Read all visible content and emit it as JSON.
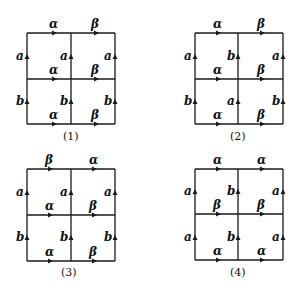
{
  "diagrams": [
    {
      "caption": "(1)",
      "top": {
        "left": "α",
        "right": "β"
      },
      "middle": {
        "left": "α",
        "right": "β"
      },
      "bottom": {
        "left": "α",
        "right": "β"
      },
      "upper_verticals": {
        "left": "a",
        "center": "a",
        "right": "a"
      },
      "lower_verticals": {
        "left": "b",
        "center": "b",
        "right": "b"
      }
    },
    {
      "caption": "(2)",
      "top": {
        "left": "α",
        "right": "β"
      },
      "middle": {
        "left": "α",
        "right": "β"
      },
      "bottom": {
        "left": "α",
        "right": "β"
      },
      "upper_verticals": {
        "left": "a",
        "center": "b",
        "right": "a"
      },
      "lower_verticals": {
        "left": "b",
        "center": "a",
        "right": "b"
      }
    },
    {
      "caption": "(3)",
      "top": {
        "left": "β",
        "right": "α"
      },
      "middle": {
        "left": "α",
        "right": "β"
      },
      "bottom": {
        "left": "α",
        "right": "β"
      },
      "upper_verticals": {
        "left": "a",
        "center": "a",
        "right": "a"
      },
      "lower_verticals": {
        "left": "b",
        "center": "b",
        "right": "b"
      }
    },
    {
      "caption": "(4)",
      "top": {
        "left": "α",
        "right": "α"
      },
      "middle": {
        "left": "β",
        "right": "β"
      },
      "bottom": {
        "left": "α",
        "right": "α"
      },
      "upper_verticals": {
        "left": "a",
        "center": "b",
        "right": "a"
      },
      "lower_verticals": {
        "left": "a",
        "center": "b",
        "right": "a"
      }
    }
  ],
  "colors": {
    "line": "#1a1a1a",
    "background": "#ffffff"
  }
}
